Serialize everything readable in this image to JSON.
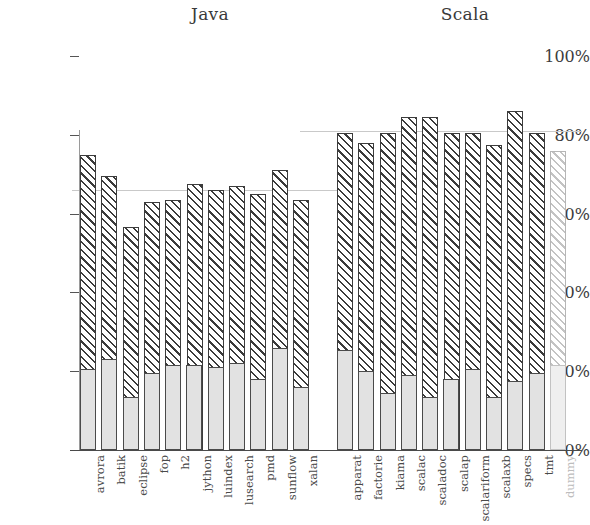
{
  "figure": {
    "groups": [
      {
        "key": "java",
        "title": "Java"
      },
      {
        "key": "scala",
        "title": "Scala"
      }
    ]
  },
  "axis": {
    "y_ticks": [
      "0%",
      "20%",
      "40%",
      "60%",
      "80%",
      "100%"
    ]
  },
  "chart_data": {
    "type": "bar",
    "title": "",
    "subtitle": "",
    "xlabel": "",
    "ylabel": "",
    "ylim": [
      0,
      100
    ],
    "y_ticks": [
      0,
      20,
      40,
      60,
      80,
      100
    ],
    "y_tick_labels": [
      "0%",
      "20%",
      "40%",
      "60%",
      "80%",
      "100%"
    ],
    "grid": false,
    "legend": null,
    "stacked": true,
    "groups": [
      {
        "name": "Java",
        "mean_line": 66,
        "categories": [
          "avrora",
          "batik",
          "eclipse",
          "fop",
          "h2",
          "jython",
          "luindex",
          "lusearch",
          "pmd",
          "sunflow",
          "xalan"
        ],
        "series": [
          {
            "name": "lower",
            "values": [
              20.5,
              23,
              13.5,
              19.5,
              21.5,
              21.5,
              21,
              22,
              18,
              26,
              16
            ]
          },
          {
            "name": "total",
            "values": [
              75,
              69.5,
              56.5,
              63,
              63.5,
              67.5,
              66,
              67,
              65,
              71,
              63.5
            ]
          }
        ]
      },
      {
        "name": "Scala",
        "mean_line": 81,
        "categories": [
          "apparat",
          "factorie",
          "kiama",
          "scalac",
          "scaladoc",
          "scalap",
          "scalariform",
          "scalaxb",
          "specs",
          "tmt",
          "dummy"
        ],
        "series": [
          {
            "name": "lower",
            "values": [
              25.5,
              20,
              14.5,
              19,
              13.5,
              18,
              20.5,
              13.5,
              17.5,
              11,
              19.5,
              21.5
            ]
          },
          {
            "name": "total",
            "values": [
              80.5,
              78,
              80.5,
              84.5,
              84.5,
              80.5,
              80.5,
              77.5,
              86,
              80.5,
              76
            ]
          }
        ]
      }
    ]
  },
  "bars": {
    "java": [
      {
        "label": "avrora",
        "total": 75.0,
        "lower": 20.5,
        "faded": false
      },
      {
        "label": "batik",
        "total": 69.5,
        "lower": 23.0,
        "faded": false
      },
      {
        "label": "eclipse",
        "total": 56.5,
        "lower": 13.5,
        "faded": false
      },
      {
        "label": "fop",
        "total": 63.0,
        "lower": 19.5,
        "faded": false
      },
      {
        "label": "h2",
        "total": 63.5,
        "lower": 21.5,
        "faded": false
      },
      {
        "label": "jython",
        "total": 67.5,
        "lower": 21.5,
        "faded": false
      },
      {
        "label": "luindex",
        "total": 66.0,
        "lower": 21.0,
        "faded": false
      },
      {
        "label": "lusearch",
        "total": 67.0,
        "lower": 22.0,
        "faded": false
      },
      {
        "label": "pmd",
        "total": 65.0,
        "lower": 18.0,
        "faded": false
      },
      {
        "label": "sunflow",
        "total": 71.0,
        "lower": 26.0,
        "faded": false
      },
      {
        "label": "xalan",
        "total": 63.5,
        "lower": 16.0,
        "faded": false
      }
    ],
    "scala": [
      {
        "label": "apparat",
        "total": 80.5,
        "lower": 25.5,
        "faded": false
      },
      {
        "label": "factorie",
        "total": 78.0,
        "lower": 20.0,
        "faded": false
      },
      {
        "label": "kiama",
        "total": 80.5,
        "lower": 14.5,
        "faded": false
      },
      {
        "label": "scalac",
        "total": 84.5,
        "lower": 19.0,
        "faded": false
      },
      {
        "label": "scaladoc",
        "total": 84.5,
        "lower": 13.5,
        "faded": false
      },
      {
        "label": "scalap",
        "total": 80.5,
        "lower": 18.0,
        "faded": false
      },
      {
        "label": "scalariform",
        "total": 80.5,
        "lower": 20.5,
        "faded": false
      },
      {
        "label": "scalaxb",
        "total": 77.5,
        "lower": 13.5,
        "faded": false
      },
      {
        "label": "specs",
        "total": 86.0,
        "lower": 17.5,
        "faded": false
      },
      {
        "label": "tmt",
        "total": 80.5,
        "lower": 19.5,
        "faded": false
      },
      {
        "label": "dummy",
        "total": 76.0,
        "lower": 21.5,
        "faded": true
      }
    ]
  }
}
